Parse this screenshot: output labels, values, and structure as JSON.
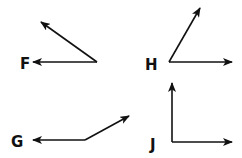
{
  "angles": [
    {
      "label": "F",
      "label_pos": [
        20,
        69
      ],
      "vertex": [
        97,
        62
      ],
      "ray1": [
        33,
        62
      ],
      "ray2": [
        41,
        22
      ]
    },
    {
      "label": "H",
      "label_pos": [
        145,
        70
      ],
      "vertex": [
        169,
        62
      ],
      "ray1": [
        232,
        62
      ],
      "ray2": [
        200,
        8
      ]
    },
    {
      "label": "G",
      "label_pos": [
        11,
        147
      ],
      "vertex": [
        85,
        140
      ],
      "ray1": [
        33,
        140
      ],
      "ray2": [
        129,
        116
      ]
    },
    {
      "label": "J",
      "label_pos": [
        150,
        150
      ],
      "vertex": [
        172,
        142
      ],
      "ray1": [
        232,
        142
      ],
      "ray2": [
        172,
        83
      ]
    }
  ],
  "colors": {
    "stroke": "#111111",
    "background": "#ffffff"
  }
}
